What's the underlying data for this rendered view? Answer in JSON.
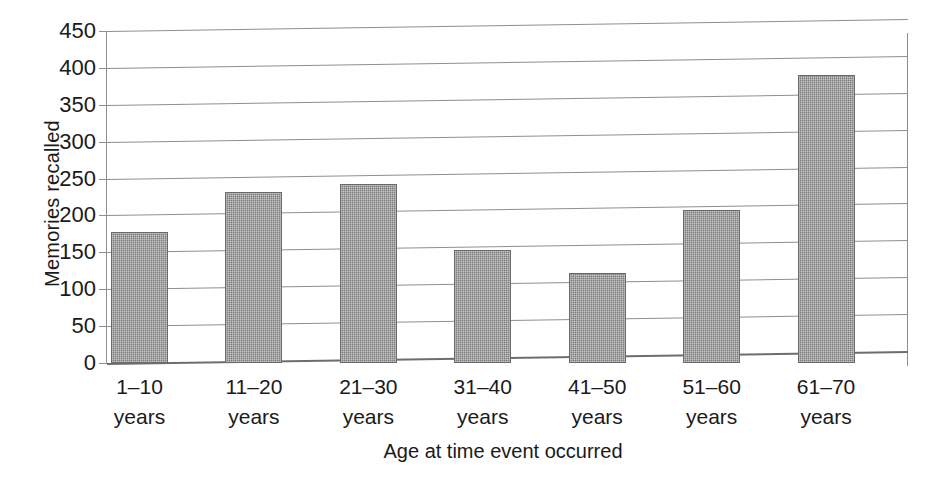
{
  "chart_data": {
    "type": "bar",
    "title": "",
    "xlabel": "Age at time event occurred",
    "ylabel": "Memories recalled",
    "categories": [
      "1–10 years",
      "11–20 years",
      "21–30 years",
      "31–40 years",
      "41–50 years",
      "51–60 years",
      "61–70 years"
    ],
    "category_lines": [
      {
        "range": "1–10",
        "unit": "years"
      },
      {
        "range": "11–20",
        "unit": "years"
      },
      {
        "range": "21–30",
        "unit": "years"
      },
      {
        "range": "31–40",
        "unit": "years"
      },
      {
        "range": "41–50",
        "unit": "years"
      },
      {
        "range": "51–60",
        "unit": "years"
      },
      {
        "range": "61–70",
        "unit": "years"
      }
    ],
    "values": [
      177,
      232,
      242,
      153,
      122,
      207,
      390
    ],
    "ylim": [
      0,
      450
    ],
    "ytick_labels": [
      "450",
      "400",
      "350",
      "300",
      "250",
      "200",
      "150",
      "100",
      "50",
      "0"
    ],
    "ytick_values": [
      450,
      400,
      350,
      300,
      250,
      200,
      150,
      100,
      50,
      0
    ],
    "ytick_step": 50,
    "grid": true,
    "legend": false,
    "legend_position": "none",
    "bar_color": "#8a8a8a",
    "bar_edge_color": "#6a6a6a",
    "grid_color": "#8f8f8f",
    "background_color": "#ffffff"
  }
}
